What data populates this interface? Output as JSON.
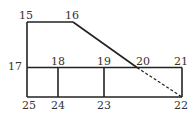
{
  "diagram": {
    "type": "labeled floor-plan line diagram",
    "stroke_color": "#222222",
    "nodes": [
      {
        "id": "15",
        "label": "15"
      },
      {
        "id": "16",
        "label": "16"
      },
      {
        "id": "17",
        "label": "17"
      },
      {
        "id": "18",
        "label": "18"
      },
      {
        "id": "19",
        "label": "19"
      },
      {
        "id": "20",
        "label": "20"
      },
      {
        "id": "21",
        "label": "21"
      },
      {
        "id": "22",
        "label": "22"
      },
      {
        "id": "23",
        "label": "23"
      },
      {
        "id": "24",
        "label": "24"
      },
      {
        "id": "25",
        "label": "25"
      }
    ],
    "edges": [
      {
        "from": "15",
        "to": "16",
        "style": "solid"
      },
      {
        "from": "15",
        "to": "17",
        "style": "solid"
      },
      {
        "from": "16",
        "to": "20",
        "style": "solid"
      },
      {
        "from": "20",
        "to": "22",
        "style": "dashed"
      },
      {
        "from": "17",
        "to": "21",
        "style": "solid"
      },
      {
        "from": "17",
        "to": "25",
        "style": "solid"
      },
      {
        "from": "25",
        "to": "22",
        "style": "solid"
      },
      {
        "from": "21",
        "to": "22",
        "style": "solid"
      },
      {
        "from": "18",
        "to": "24",
        "style": "solid"
      },
      {
        "from": "19",
        "to": "23",
        "style": "solid"
      }
    ]
  }
}
